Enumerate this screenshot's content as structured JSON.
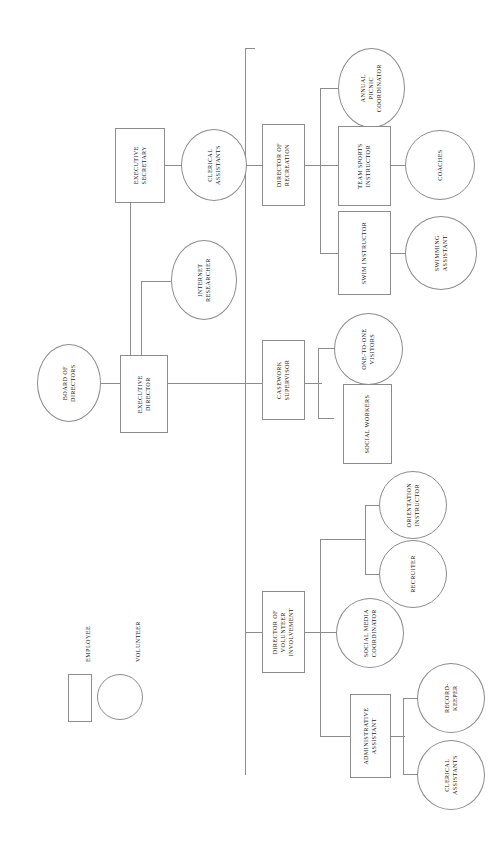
{
  "chart_data": {
    "type": "diagram",
    "orientation": "rotated-90",
    "legend": {
      "position": "left",
      "entries": [
        {
          "label": "EMPLOYEE",
          "shape": "rectangle"
        },
        {
          "label": "VOLUNTEER",
          "shape": "circle"
        }
      ]
    },
    "nodes": [
      {
        "id": "board",
        "label": "BOARD OF\nDIRECTORS",
        "shape": "circle"
      },
      {
        "id": "execdir",
        "label": "EXECUTIVE\nDIRECTOR",
        "shape": "rectangle"
      },
      {
        "id": "execsec",
        "label": "EXECUTIVE\nSECRETARY",
        "shape": "rectangle"
      },
      {
        "id": "clerical1",
        "label": "CLERICAL\nASSISTANTS",
        "shape": "circle"
      },
      {
        "id": "internet",
        "label": "INTERNET\nRESEARCHER",
        "shape": "circle"
      },
      {
        "id": "dirrec",
        "label": "DIRECTOR OF\nRECREATION",
        "shape": "rectangle"
      },
      {
        "id": "picnic",
        "label": "ANNUAL\nPICNIC\nCOORDINATOR",
        "shape": "circle"
      },
      {
        "id": "teamsports",
        "label": "TEAM SPORTS\nINSTRUCTOR",
        "shape": "rectangle"
      },
      {
        "id": "coaches",
        "label": "COACHES",
        "shape": "circle"
      },
      {
        "id": "swim",
        "label": "SWIM INSTRUCTOR",
        "shape": "rectangle"
      },
      {
        "id": "swimasst",
        "label": "SWIMMING\nASSISTANT",
        "shape": "circle"
      },
      {
        "id": "casework",
        "label": "CASEWORK\nSUPERVISOR",
        "shape": "rectangle"
      },
      {
        "id": "onetoone",
        "label": "ONE-TO-ONE\nVISITORS",
        "shape": "circle"
      },
      {
        "id": "socialwork",
        "label": "SOCIAL WORKERS",
        "shape": "rectangle"
      },
      {
        "id": "dirvol",
        "label": "DIRECTOR OF\nVOLUNTEER\nINVOLVEMENT",
        "shape": "rectangle"
      },
      {
        "id": "orientation",
        "label": "ORIENTATION\nINSTRUCTOR",
        "shape": "circle"
      },
      {
        "id": "recruiter",
        "label": "RECRUITER",
        "shape": "circle"
      },
      {
        "id": "socialmedia",
        "label": "SOCIAL MEDIA\nCOORDINATOR",
        "shape": "circle"
      },
      {
        "id": "adminasst",
        "label": "ADMINISTRATIVE\nASSISTANT",
        "shape": "rectangle"
      },
      {
        "id": "recordkeeper",
        "label": "RECORD-\nKEEPER",
        "shape": "circle"
      },
      {
        "id": "clerical2",
        "label": "CLERICAL\nASSISTANTS",
        "shape": "circle"
      }
    ],
    "edges": [
      {
        "from": "board",
        "to": "execdir"
      },
      {
        "from": "execdir",
        "to": "execsec"
      },
      {
        "from": "execdir",
        "to": "internet"
      },
      {
        "from": "execsec",
        "to": "clerical1"
      },
      {
        "from": "execdir",
        "to": "dirrec"
      },
      {
        "from": "execdir",
        "to": "casework"
      },
      {
        "from": "execdir",
        "to": "dirvol"
      },
      {
        "from": "dirrec",
        "to": "picnic"
      },
      {
        "from": "dirrec",
        "to": "teamsports"
      },
      {
        "from": "dirrec",
        "to": "swim"
      },
      {
        "from": "teamsports",
        "to": "coaches"
      },
      {
        "from": "swim",
        "to": "swimasst"
      },
      {
        "from": "casework",
        "to": "onetoone"
      },
      {
        "from": "casework",
        "to": "socialwork"
      },
      {
        "from": "dirvol",
        "to": "recruiter"
      },
      {
        "from": "dirvol",
        "to": "orientation"
      },
      {
        "from": "dirvol",
        "to": "socialmedia"
      },
      {
        "from": "dirvol",
        "to": "adminasst"
      },
      {
        "from": "adminasst",
        "to": "recordkeeper"
      },
      {
        "from": "adminasst",
        "to": "clerical2"
      }
    ],
    "colors": {
      "line": "#8c8c8c",
      "text": "#1c1c1c",
      "background": "#ffffff"
    }
  }
}
